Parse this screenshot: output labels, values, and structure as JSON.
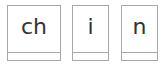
{
  "tiles": [
    {
      "text": "ch"
    },
    {
      "text": "i"
    },
    {
      "text": "n"
    }
  ]
}
